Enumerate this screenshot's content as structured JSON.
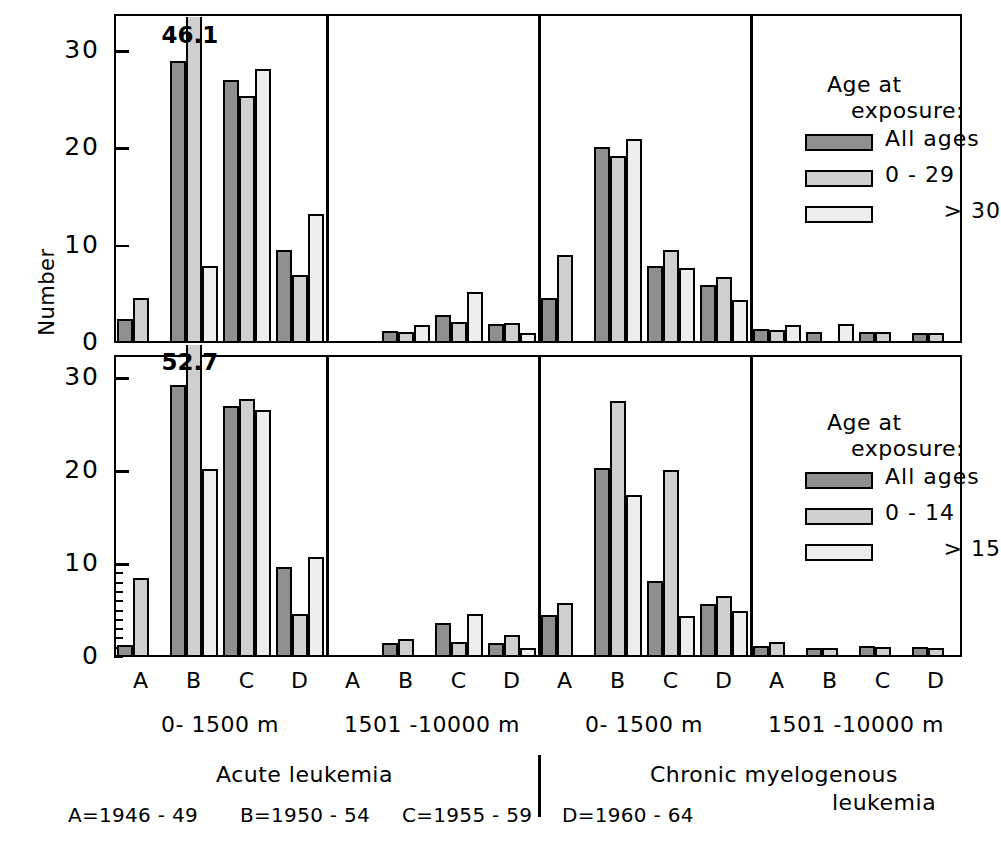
{
  "axis": {
    "ylabel": "Number",
    "yticks": [
      0,
      10,
      20,
      30
    ],
    "ylim": [
      0,
      33.5
    ]
  },
  "groups": [
    {
      "key": "A",
      "label": "A"
    },
    {
      "key": "B",
      "label": "B"
    },
    {
      "key": "C",
      "label": "C"
    },
    {
      "key": "D",
      "label": "D"
    }
  ],
  "distance_labels": {
    "near": "0- 1500 m",
    "far": "1501 -10000 m"
  },
  "diseases": {
    "acute": "Acute  leukemia",
    "cml_line1": "Chronic myelogenous",
    "cml_line2": "leukemia"
  },
  "footnote": {
    "a": "A=1946 - 49",
    "b": "B=1950 - 54",
    "c": "C=1955 - 59",
    "d": "D=1960 - 64"
  },
  "legend_top": {
    "title_line1": "Age at",
    "title_line2": "exposure:",
    "items": [
      {
        "label": "All ages",
        "series": "all",
        "color": "#8f8f8f"
      },
      {
        "label": "0 -  29",
        "series": "mid",
        "color": "#cfcfcf"
      },
      {
        "label": "> 30",
        "series": "high",
        "color": "#eeeeee"
      }
    ]
  },
  "legend_bottom": {
    "title_line1": "Age at",
    "title_line2": "exposure:",
    "items": [
      {
        "label": "All ages",
        "series": "all",
        "color": "#8f8f8f"
      },
      {
        "label": "0 -  14",
        "series": "mid",
        "color": "#cfcfcf"
      },
      {
        "label": "> 15",
        "series": "high",
        "color": "#eeeeee"
      }
    ]
  },
  "annotations": {
    "peak_top": "46.1",
    "peak_bottom": "52.7"
  },
  "chart_data": {
    "type": "bar",
    "title": "",
    "xlabel": "Calendar period of diagnosis (A=1946-49, B=1950-54, C=1955-59, D=1960-64)",
    "ylabel": "Number",
    "ylim": [
      0,
      33.5
    ],
    "yticks": [
      0,
      10,
      20,
      30
    ],
    "grid": false,
    "legend_position": "right",
    "note": "Bar heights are clipped at the top of the axis; the true values of the clipped B-group bars are given as data labels 46.1 (top row) and 52.7 (bottom row).",
    "categories": [
      "A",
      "B",
      "C",
      "D"
    ],
    "panels": [
      {
        "panel": "acute-near",
        "disease": "Acute leukemia",
        "distance": "0-1500 m",
        "row": "top",
        "series": [
          {
            "name": "All ages",
            "values": [
              2.5,
              29.0,
              27.0,
              9.6
            ]
          },
          {
            "name": "0 - 29",
            "values": [
              4.6,
              46.1,
              25.4,
              7.0
            ]
          },
          {
            "name": "> 30",
            "values": [
              0.0,
              7.9,
              28.2,
              13.3
            ]
          }
        ]
      },
      {
        "panel": "acute-far",
        "disease": "Acute leukemia",
        "distance": "1501-10000 m",
        "row": "top",
        "series": [
          {
            "name": "All ages",
            "values": [
              0.0,
              1.2,
              2.9,
              2.0
            ]
          },
          {
            "name": "0 - 29",
            "values": [
              0.0,
              1.1,
              2.2,
              2.1
            ]
          },
          {
            "name": "> 30",
            "values": [
              0.0,
              1.8,
              5.2,
              1.0
            ]
          }
        ]
      },
      {
        "panel": "cml-near",
        "disease": "Chronic myelogenous leukemia",
        "distance": "0-1500 m",
        "row": "top",
        "series": [
          {
            "name": "All ages",
            "values": [
              4.6,
              20.1,
              7.9,
              6.0
            ]
          },
          {
            "name": "0 - 29",
            "values": [
              9.0,
              19.2,
              9.6,
              6.8
            ]
          },
          {
            "name": "> 30",
            "values": [
              0.0,
              21.0,
              7.7,
              4.4
            ]
          }
        ]
      },
      {
        "panel": "cml-far",
        "disease": "Chronic myelogenous leukemia",
        "distance": "1501-10000 m",
        "row": "top",
        "series": [
          {
            "name": "All ages",
            "values": [
              1.4,
              1.1,
              1.1,
              1.0
            ]
          },
          {
            "name": "0 - 29",
            "values": [
              1.3,
              0.0,
              1.1,
              1.0
            ]
          },
          {
            "name": "> 30",
            "values": [
              1.8,
              2.0,
              0.0,
              0.0
            ]
          }
        ]
      },
      {
        "panel": "acute-near-b",
        "disease": "Acute leukemia",
        "distance": "0-1500 m",
        "row": "bottom",
        "series": [
          {
            "name": "All ages",
            "values": [
              1.3,
              29.3,
              27.0,
              9.7
            ]
          },
          {
            "name": "0 - 14",
            "values": [
              8.5,
              52.7,
              27.7,
              4.6
            ]
          },
          {
            "name": "> 15",
            "values": [
              0.0,
              20.2,
              26.6,
              10.8
            ]
          }
        ]
      },
      {
        "panel": "acute-far-b",
        "disease": "Acute leukemia",
        "distance": "1501-10000 m",
        "row": "bottom",
        "series": [
          {
            "name": "All ages",
            "values": [
              0.0,
              1.5,
              3.7,
              1.5
            ]
          },
          {
            "name": "0 - 14",
            "values": [
              0.0,
              1.9,
              1.6,
              2.4
            ]
          },
          {
            "name": "> 15",
            "values": [
              0.0,
              0.0,
              4.6,
              1.0
            ]
          }
        ]
      },
      {
        "panel": "cml-near-b",
        "disease": "Chronic myelogenous leukemia",
        "distance": "0-1500 m",
        "row": "bottom",
        "series": [
          {
            "name": "All ages",
            "values": [
              4.5,
              20.3,
              8.2,
              5.7
            ]
          },
          {
            "name": "0 - 14",
            "values": [
              5.8,
              27.5,
              20.1,
              6.6
            ]
          },
          {
            "name": "> 15",
            "values": [
              0.0,
              17.4,
              4.4,
              5.0
            ]
          }
        ]
      },
      {
        "panel": "cml-far-b",
        "disease": "Chronic myelogenous leukemia",
        "distance": "1501-10000 m",
        "row": "bottom",
        "series": [
          {
            "name": "All ages",
            "values": [
              1.2,
              1.0,
              1.2,
              1.1
            ]
          },
          {
            "name": "0 - 14",
            "values": [
              1.6,
              1.0,
              1.1,
              1.0
            ]
          },
          {
            "name": "> 15",
            "values": [
              0.0,
              0.0,
              0.0,
              0.0
            ]
          }
        ]
      }
    ]
  }
}
